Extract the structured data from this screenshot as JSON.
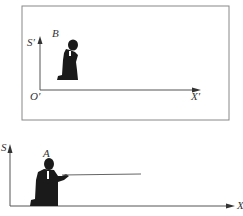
{
  "diagram": {
    "frame_B": {
      "observer_label": "B",
      "y_axis_label": "S′",
      "origin_label": "O′",
      "x_axis_label": "X′"
    },
    "frame_A": {
      "observer_label": "A",
      "y_axis_label": "S",
      "x_axis_label": "X"
    },
    "colors": {
      "line": "#555555",
      "figure": "#1a1a1a",
      "box": "#888888"
    }
  }
}
